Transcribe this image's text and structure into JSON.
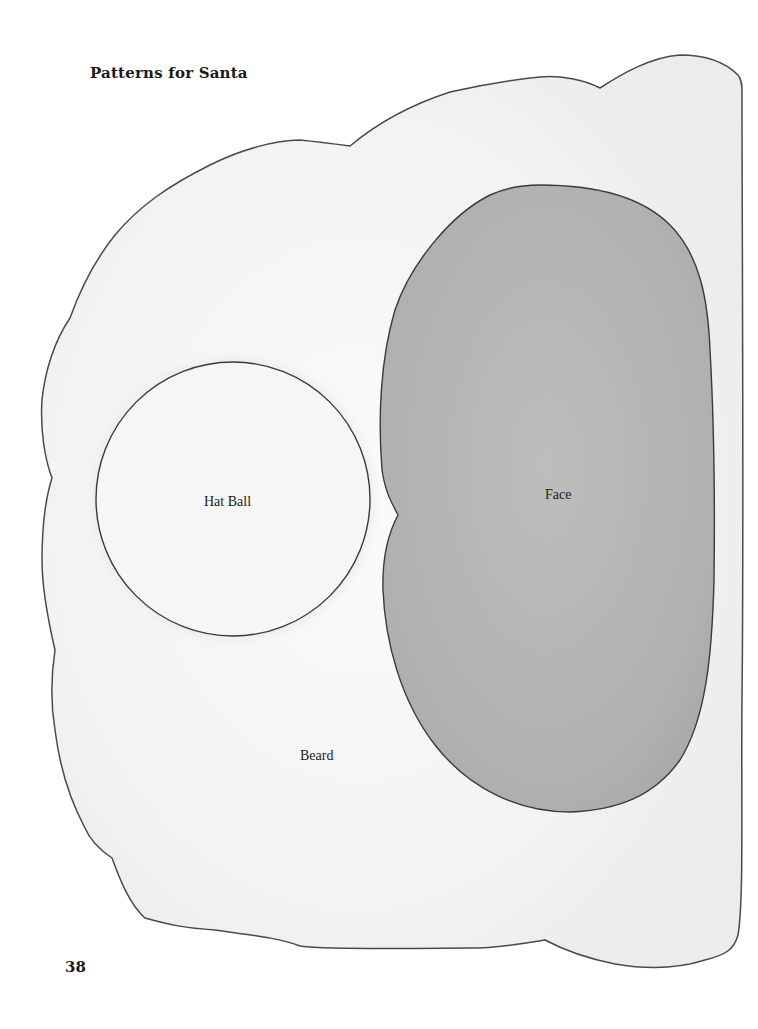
{
  "page": {
    "title": "Patterns for Santa",
    "page_number": "38"
  },
  "pieces": {
    "beard": {
      "label": "Beard",
      "fill": "#f7f7f7",
      "stroke": "#4a4a4a"
    },
    "hat_ball": {
      "label": "Hat Ball",
      "fill": "#f4f4f4",
      "stroke": "#3a3a3a"
    },
    "face": {
      "label": "Face",
      "fill": "#b4b4b4",
      "stroke": "#3a3a3a"
    }
  }
}
